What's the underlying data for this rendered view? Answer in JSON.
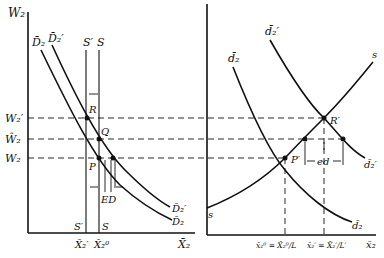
{
  "left_panel": {
    "y_axis_label": "W₂",
    "x_axis_label": "X̄₂",
    "wage_labels": [
      "W₂′",
      "Ŵ₂",
      "W₂"
    ],
    "supply_labels_top": [
      "S′",
      "S"
    ],
    "supply_labels_bottom": [
      "S′",
      "S"
    ],
    "x_tick_labels": [
      "X̄₂′",
      "X̄₂⁰"
    ],
    "demand_labels_top": [
      "D̄₂",
      "D̄₂′"
    ],
    "demand_labels_right": [
      "D̄₂′",
      "D̄₂"
    ],
    "points": [
      "R",
      "Q",
      "P"
    ],
    "excess_label": "ED"
  },
  "right_panel": {
    "x_axis_label": "x̄₂",
    "demand_labels_top": [
      "d̄₂",
      "d̄₂′"
    ],
    "demand_labels_right": [
      "d̄₂′",
      "d̄₂"
    ],
    "supply_label_top": "s",
    "supply_label_bottom": "s",
    "points": [
      "R′",
      "P′"
    ],
    "excess_label": "ed",
    "x_tick_labels": [
      "x̄₂⁰ = X̄₂⁰/L",
      "x̄₂′ = X̄₂′/L′"
    ]
  },
  "colors": {
    "ink": "#111111",
    "background": "#ffffff"
  }
}
